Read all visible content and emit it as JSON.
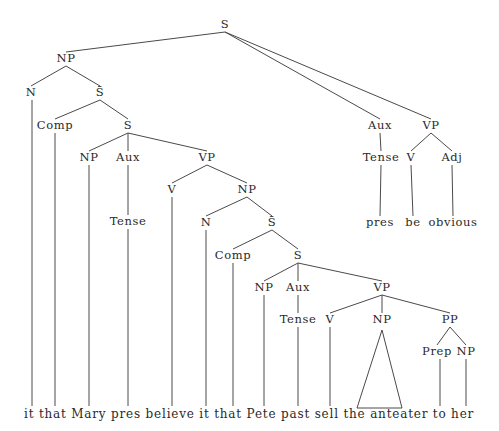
{
  "diagram": {
    "type": "syntax-tree",
    "nodes": [
      {
        "id": "S0",
        "label": "S",
        "x": 225,
        "y": 28
      },
      {
        "id": "NP1",
        "label": "NP",
        "x": 66,
        "y": 62
      },
      {
        "id": "N1",
        "label": "N",
        "x": 31,
        "y": 96
      },
      {
        "id": "SB1",
        "label": "S̄",
        "x": 100,
        "y": 96
      },
      {
        "id": "Comp1",
        "label": "Comp",
        "x": 55,
        "y": 129
      },
      {
        "id": "S1",
        "label": "S",
        "x": 128,
        "y": 129
      },
      {
        "id": "NP2",
        "label": "NP",
        "x": 89,
        "y": 161
      },
      {
        "id": "Aux1",
        "label": "Aux",
        "x": 128,
        "y": 161
      },
      {
        "id": "VP1",
        "label": "VP",
        "x": 207,
        "y": 161
      },
      {
        "id": "Tense1",
        "label": "Tense",
        "x": 128,
        "y": 225
      },
      {
        "id": "V1",
        "label": "V",
        "x": 172,
        "y": 193
      },
      {
        "id": "NP3",
        "label": "NP",
        "x": 247,
        "y": 193
      },
      {
        "id": "N2",
        "label": "N",
        "x": 206,
        "y": 226
      },
      {
        "id": "SB2",
        "label": "S̄",
        "x": 272,
        "y": 226
      },
      {
        "id": "Comp2",
        "label": "Comp",
        "x": 233,
        "y": 259
      },
      {
        "id": "S2",
        "label": "S",
        "x": 298,
        "y": 259
      },
      {
        "id": "NP4",
        "label": "NP",
        "x": 264,
        "y": 291
      },
      {
        "id": "Aux2",
        "label": "Aux",
        "x": 298,
        "y": 291
      },
      {
        "id": "VP2",
        "label": "VP",
        "x": 382,
        "y": 291
      },
      {
        "id": "Tense2",
        "label": "Tense",
        "x": 298,
        "y": 323
      },
      {
        "id": "V2",
        "label": "V",
        "x": 330,
        "y": 323
      },
      {
        "id": "NP5",
        "label": "NP",
        "x": 382,
        "y": 323
      },
      {
        "id": "PP1",
        "label": "PP",
        "x": 450,
        "y": 323
      },
      {
        "id": "Prep1",
        "label": "Prep",
        "x": 437,
        "y": 355
      },
      {
        "id": "NP6",
        "label": "NP",
        "x": 466,
        "y": 355
      },
      {
        "id": "Aux3",
        "label": "Aux",
        "x": 380,
        "y": 129
      },
      {
        "id": "VP3",
        "label": "VP",
        "x": 431,
        "y": 129
      },
      {
        "id": "Tense3",
        "label": "Tense",
        "x": 381,
        "y": 161
      },
      {
        "id": "V3",
        "label": "V",
        "x": 411,
        "y": 161
      },
      {
        "id": "Adj1",
        "label": "Adj",
        "x": 452,
        "y": 161
      },
      {
        "id": "w_pres2",
        "label": "pres",
        "x": 380,
        "y": 226
      },
      {
        "id": "w_be",
        "label": "be",
        "x": 413,
        "y": 226
      },
      {
        "id": "w_obvious",
        "label": "obvious",
        "x": 453,
        "y": 226
      }
    ],
    "edges": [
      [
        "S0",
        "NP1"
      ],
      [
        "S0",
        "Aux3"
      ],
      [
        "S0",
        "VP3"
      ],
      [
        "NP1",
        "N1"
      ],
      [
        "NP1",
        "SB1"
      ],
      [
        "SB1",
        "Comp1"
      ],
      [
        "SB1",
        "S1"
      ],
      [
        "S1",
        "NP2"
      ],
      [
        "S1",
        "Aux1"
      ],
      [
        "S1",
        "VP1"
      ],
      [
        "Aux1",
        "Tense1"
      ],
      [
        "VP1",
        "V1"
      ],
      [
        "VP1",
        "NP3"
      ],
      [
        "NP3",
        "N2"
      ],
      [
        "NP3",
        "SB2"
      ],
      [
        "SB2",
        "Comp2"
      ],
      [
        "SB2",
        "S2"
      ],
      [
        "S2",
        "NP4"
      ],
      [
        "S2",
        "Aux2"
      ],
      [
        "S2",
        "VP2"
      ],
      [
        "Aux2",
        "Tense2"
      ],
      [
        "VP2",
        "V2"
      ],
      [
        "VP2",
        "NP5"
      ],
      [
        "VP2",
        "PP1"
      ],
      [
        "PP1",
        "Prep1"
      ],
      [
        "PP1",
        "NP6"
      ],
      [
        "Aux3",
        "Tense3"
      ],
      [
        "VP3",
        "V3"
      ],
      [
        "VP3",
        "Adj1"
      ],
      [
        "Tense3",
        "w_pres2"
      ],
      [
        "V3",
        "w_be"
      ],
      [
        "Adj1",
        "w_obvious"
      ]
    ],
    "leaf_lines": [
      {
        "from": "N1",
        "x": 32
      },
      {
        "from": "Comp1",
        "x": 55
      },
      {
        "from": "NP2",
        "x": 89
      },
      {
        "from": "Tense1",
        "x": 128
      },
      {
        "from": "V1",
        "x": 172
      },
      {
        "from": "N2",
        "x": 206
      },
      {
        "from": "Comp2",
        "x": 233
      },
      {
        "from": "NP4",
        "x": 264
      },
      {
        "from": "Tense2",
        "x": 298
      },
      {
        "from": "V2",
        "x": 330
      },
      {
        "from": "Prep1",
        "x": 440
      },
      {
        "from": "NP6",
        "x": 466
      }
    ],
    "triangle": {
      "from": "NP5",
      "apex_x": 382,
      "apex_y": 330,
      "left_x": 357,
      "right_x": 402,
      "base_y": 408
    },
    "terminal_baseline_y": 418,
    "terminal_string": "it that Mary pres believe it that Pete past sell the anteater to her",
    "terminals": [
      {
        "text": "it",
        "x": 32
      },
      {
        "text": "that",
        "x": 56
      },
      {
        "text": "Mary",
        "x": 90
      },
      {
        "text": "pres",
        "x": 128
      },
      {
        "text": "believe",
        "x": 172
      },
      {
        "text": "it",
        "x": 206
      },
      {
        "text": "that",
        "x": 233
      },
      {
        "text": "Pete",
        "x": 264
      },
      {
        "text": "past",
        "x": 298
      },
      {
        "text": "sell",
        "x": 330
      },
      {
        "text": "the",
        "x": 357
      },
      {
        "text": "anteater",
        "x": 402
      },
      {
        "text": "to",
        "x": 440
      },
      {
        "text": "her",
        "x": 467
      }
    ]
  }
}
